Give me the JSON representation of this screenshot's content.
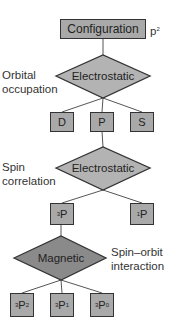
{
  "diagram": {
    "root": {
      "label": "Configuration",
      "annotation": "p",
      "annotation_sup": "2"
    },
    "stages": [
      {
        "side_label_1": "Orbital",
        "side_label_2": "occupation",
        "node": "Electrostatic"
      },
      {
        "side_label_1": "Spin",
        "side_label_2": "correlation",
        "node": "Electrostatic"
      },
      {
        "side_label_1": "Spin–orbit",
        "side_label_2": "interaction",
        "node": "Magnetic"
      }
    ],
    "terms": [
      {
        "label": "D"
      },
      {
        "label": "P"
      },
      {
        "label": "S"
      }
    ],
    "multiplets": [
      {
        "sup": "3",
        "label": "P"
      },
      {
        "sup": "1",
        "label": "P"
      }
    ],
    "levels": [
      {
        "sup": "3",
        "label": "P",
        "sub": "2"
      },
      {
        "sup": "3",
        "label": "P",
        "sub": "1"
      },
      {
        "sup": "3",
        "label": "P",
        "sub": "0"
      }
    ],
    "colors": {
      "box_fill": "#a9a9a9",
      "diamond_fill": "#b3b3b3",
      "magnetic_fill": "#8a8a8a",
      "stroke": "#333333"
    }
  }
}
